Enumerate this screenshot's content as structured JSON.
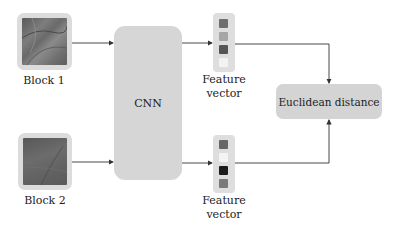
{
  "diagram": {
    "inputs": [
      {
        "label": "Block 1",
        "texture": "dark-gray-textured"
      },
      {
        "label": "Block 2",
        "texture": "dark-gray-textured"
      }
    ],
    "network": {
      "label": "CNN"
    },
    "features": [
      {
        "label_line1": "Feature",
        "label_line2": "vector",
        "cells": [
          "#6e6e6e",
          "#a6a6a6",
          "#555555",
          "#f3f3f3"
        ]
      },
      {
        "label_line1": "Feature",
        "label_line2": "vector",
        "cells": [
          "#666666",
          "#f4f4f4",
          "#1c1c1c",
          "#7a7a7a"
        ]
      }
    ],
    "output": {
      "label": "Euclidean distance"
    },
    "colors": {
      "box_fill": "#d6d6d6",
      "arrow": "#333333",
      "background": "#ffffff"
    }
  }
}
